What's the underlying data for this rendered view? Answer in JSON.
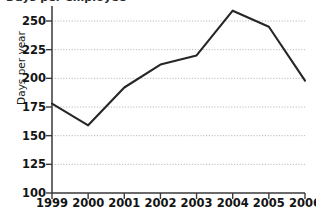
{
  "chart_data": {
    "type": "line",
    "title": "Days per employee",
    "title_clipped": true,
    "subtitle": "",
    "xlabel": "",
    "ylabel": "Days per year",
    "categories": [
      "1999",
      "2000",
      "2001",
      "2002",
      "2003",
      "2004",
      "2005",
      "2006"
    ],
    "x": [
      1999,
      2000,
      2001,
      2002,
      2003,
      2004,
      2005,
      2006
    ],
    "values": [
      178,
      159,
      192,
      212,
      220,
      259,
      245,
      198
    ],
    "series": [
      {
        "name": "Days per year",
        "values": [
          178,
          159,
          192,
          212,
          220,
          259,
          245,
          198
        ],
        "color": "#262626"
      }
    ],
    "ylim": [
      100,
      262
    ],
    "y_ticks": [
      100,
      125,
      150,
      175,
      200,
      225,
      250
    ],
    "y_tick_labels": [
      "100",
      "125",
      "150",
      "175",
      "200",
      "225",
      "250"
    ],
    "x_ticks": [
      1999,
      2000,
      2001,
      2002,
      2003,
      2004,
      2005,
      2006
    ],
    "xlim": [
      1999,
      2006
    ],
    "grid": true,
    "grid_axis": "y",
    "grid_style": "dotted",
    "grid_color": "#a8a8a8",
    "legend": false,
    "legend_position": "none",
    "markers": false,
    "background_color": "#ffffff",
    "axis_color": "#3a3a3a",
    "annotations": []
  }
}
